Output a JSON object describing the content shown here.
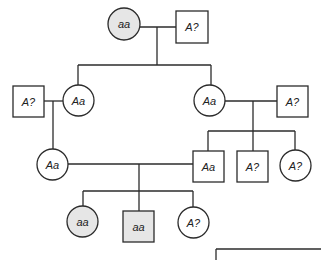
{
  "diagram": {
    "type": "pedigree",
    "colors": {
      "line": "#2b2b2b",
      "affected_fill": "#e6e6e6",
      "unaffected_fill": "#ffffff",
      "text": "#222222"
    },
    "individuals": [
      {
        "id": "gen1-female",
        "shape": "circle",
        "label": "aa",
        "affected": true,
        "x": 108,
        "y": 8,
        "size": 32
      },
      {
        "id": "gen1-male",
        "shape": "square",
        "label": "A?",
        "affected": false,
        "x": 176,
        "y": 11,
        "size": 32
      },
      {
        "id": "gen2-left-spouse-male",
        "shape": "square",
        "label": "A?",
        "affected": false,
        "x": 13,
        "y": 86,
        "size": 31
      },
      {
        "id": "gen2-left-female",
        "shape": "circle",
        "label": "Aa",
        "affected": false,
        "x": 63,
        "y": 85,
        "size": 31
      },
      {
        "id": "gen2-right-female",
        "shape": "circle",
        "label": "Aa",
        "affected": false,
        "x": 194,
        "y": 85,
        "size": 31
      },
      {
        "id": "gen2-right-spouse-male",
        "shape": "square",
        "label": "A?",
        "affected": false,
        "x": 277,
        "y": 86,
        "size": 31
      },
      {
        "id": "gen3-left-female",
        "shape": "circle",
        "label": "Aa",
        "affected": false,
        "x": 37,
        "y": 149,
        "size": 31
      },
      {
        "id": "gen3-male-Aa",
        "shape": "square",
        "label": "Aa",
        "affected": false,
        "x": 193,
        "y": 151,
        "size": 31
      },
      {
        "id": "gen3-male-A?",
        "shape": "square",
        "label": "A?",
        "affected": false,
        "x": 237,
        "y": 151,
        "size": 31
      },
      {
        "id": "gen3-female-A?",
        "shape": "circle",
        "label": "A?",
        "affected": false,
        "x": 280,
        "y": 150,
        "size": 31
      },
      {
        "id": "gen4-female-aa",
        "shape": "circle",
        "label": "aa",
        "affected": true,
        "x": 67,
        "y": 206,
        "size": 31
      },
      {
        "id": "gen4-male-aa",
        "shape": "square",
        "label": "aa",
        "affected": true,
        "x": 123,
        "y": 211,
        "size": 31
      },
      {
        "id": "gen4-female-A?",
        "shape": "circle",
        "label": "A?",
        "affected": false,
        "x": 178,
        "y": 207,
        "size": 31
      }
    ],
    "lines": [
      [
        140,
        27,
        176,
        27
      ],
      [
        157,
        27,
        157,
        65
      ],
      [
        78,
        65,
        211,
        65
      ],
      [
        78,
        65,
        78,
        85
      ],
      [
        211,
        65,
        211,
        85
      ],
      [
        44,
        101,
        63,
        101
      ],
      [
        53,
        101,
        53,
        149
      ],
      [
        225,
        101,
        277,
        101
      ],
      [
        253,
        101,
        253,
        131
      ],
      [
        208,
        131,
        295,
        131
      ],
      [
        208,
        131,
        208,
        151
      ],
      [
        253,
        131,
        253,
        151
      ],
      [
        295,
        131,
        295,
        150
      ],
      [
        68,
        164,
        193,
        164
      ],
      [
        139,
        164,
        139,
        191
      ],
      [
        83,
        191,
        193,
        191
      ],
      [
        83,
        191,
        83,
        206
      ],
      [
        139,
        191,
        139,
        211
      ],
      [
        193,
        191,
        193,
        207
      ],
      [
        216,
        249,
        321,
        249
      ],
      [
        216,
        249,
        216,
        260
      ]
    ],
    "partial_box": {
      "x": 216,
      "y": 249
    }
  }
}
